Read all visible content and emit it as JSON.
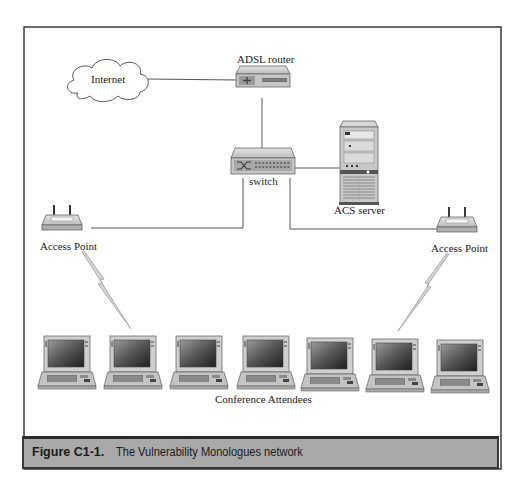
{
  "diagram": {
    "nodes": {
      "internet": {
        "label": "Internet",
        "icon": "cloud-icon"
      },
      "router": {
        "label": "ADSL router",
        "icon": "router-icon"
      },
      "switch": {
        "label": "switch",
        "icon": "switch-icon"
      },
      "server": {
        "label": "ACS server",
        "icon": "server-tower-icon"
      },
      "ap_left": {
        "label": "Access Point",
        "icon": "wireless-access-point-icon"
      },
      "ap_right": {
        "label": "Access Point",
        "icon": "wireless-access-point-icon"
      },
      "attendees": {
        "label": "Conference Attendees",
        "icon": "laptop-icon",
        "count": 7
      }
    },
    "edges": [
      {
        "from": "internet",
        "to": "router",
        "type": "wired"
      },
      {
        "from": "router",
        "to": "switch",
        "type": "wired"
      },
      {
        "from": "switch",
        "to": "server",
        "type": "wired"
      },
      {
        "from": "switch",
        "to": "ap_left",
        "type": "wired"
      },
      {
        "from": "switch",
        "to": "ap_right",
        "type": "wired"
      },
      {
        "from": "ap_left",
        "to": "attendees",
        "type": "wireless"
      },
      {
        "from": "ap_right",
        "to": "attendees",
        "type": "wireless"
      }
    ]
  },
  "caption": {
    "figure_number": "Figure C1-1.",
    "title": "The Vulnerability Monologues network"
  },
  "colors": {
    "frame": "#3a3a3a",
    "caption_bg": "#a9a9a9",
    "device_body": "#c8c8c8",
    "line": "#555555"
  }
}
